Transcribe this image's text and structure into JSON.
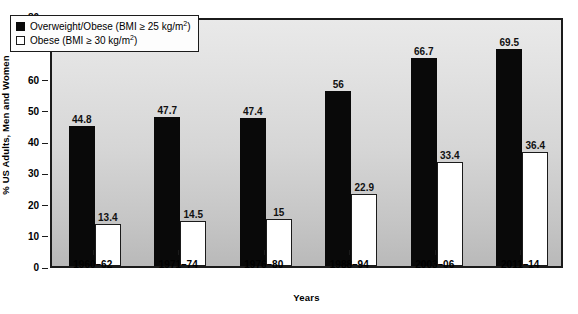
{
  "chart_data": {
    "type": "bar",
    "title": "",
    "xlabel": "Years",
    "ylabel": "% US Adults, Men and Women",
    "ylim": [
      0,
      80
    ],
    "ytick_step": 10,
    "yticks": [
      "80",
      "70",
      "60",
      "50",
      "40",
      "30",
      "20",
      "10",
      "0"
    ],
    "grid": false,
    "legend_position": "upper-left-inside",
    "categories": [
      "1960–62",
      "1971–74",
      "1976–80",
      "1988–94",
      "2003–06",
      "2011–14"
    ],
    "series": [
      {
        "name": "Overweight/Obese (BMI ≥ 25 kg/m2)",
        "legend_prefix": "Overweight/Obese (BMI ≥ 25 kg/m",
        "legend_suffix": ")",
        "legend_sup": "2",
        "color": "#090909",
        "style": "filled-black",
        "values": [
          44.8,
          47.7,
          47.4,
          56,
          66.7,
          69.5
        ],
        "labels": [
          "44.8",
          "47.7",
          "47.4",
          "56",
          "66.7",
          "69.5"
        ]
      },
      {
        "name": "Obese (BMI ≥ 30 kg/m2)",
        "legend_prefix": "Obese (BMI ≥ 30 kg/m",
        "legend_suffix": ")",
        "legend_sup": "2",
        "color": "#ffffff",
        "style": "outlined-white",
        "values": [
          13.4,
          14.5,
          15,
          22.9,
          33.4,
          36.4
        ],
        "labels": [
          "13.4",
          "14.5",
          "15",
          "22.9",
          "33.4",
          "36.4"
        ]
      }
    ]
  },
  "colors": {
    "bar_dark": "#090909",
    "bar_light": "#ffffff",
    "axis": "#1b1b1b",
    "plot_bg_top": "#e9e9e9",
    "plot_bg_bottom": "#b9b9b9",
    "text": "#000000"
  }
}
